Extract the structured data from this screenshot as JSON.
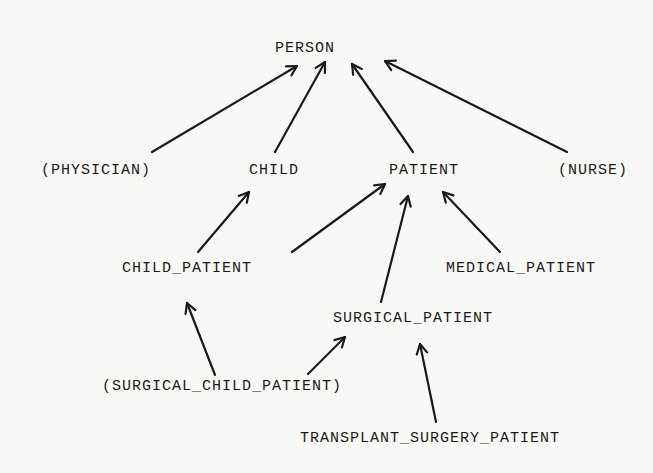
{
  "diagram": {
    "type": "is-a hierarchy",
    "nodes": [
      {
        "id": "person",
        "label": "PERSON",
        "x": 305,
        "y": 48
      },
      {
        "id": "physician",
        "label": "(PHYSICIAN)",
        "x": 96,
        "y": 170
      },
      {
        "id": "child",
        "label": "CHILD",
        "x": 274,
        "y": 170
      },
      {
        "id": "patient",
        "label": "PATIENT",
        "x": 424,
        "y": 170
      },
      {
        "id": "nurse",
        "label": "(NURSE)",
        "x": 593,
        "y": 170
      },
      {
        "id": "child_patient",
        "label": "CHILD_PATIENT",
        "x": 187,
        "y": 268
      },
      {
        "id": "medical_patient",
        "label": "MEDICAL_PATIENT",
        "x": 521,
        "y": 268
      },
      {
        "id": "surgical_patient",
        "label": "SURGICAL_PATIENT",
        "x": 413,
        "y": 318
      },
      {
        "id": "surgical_child_patient",
        "label": "(SURGICAL_CHILD_PATIENT)",
        "x": 222,
        "y": 386
      },
      {
        "id": "transplant_surgery_patient",
        "label": "TRANSPLANT_SURGERY_PATIENT",
        "x": 430,
        "y": 438
      }
    ],
    "edges": [
      {
        "from": "physician",
        "to": "person",
        "x1": 152,
        "y1": 152,
        "x2": 297,
        "y2": 66
      },
      {
        "from": "child",
        "to": "person",
        "x1": 275,
        "y1": 152,
        "x2": 325,
        "y2": 62
      },
      {
        "from": "patient",
        "to": "person",
        "x1": 413,
        "y1": 152,
        "x2": 352,
        "y2": 64
      },
      {
        "from": "nurse",
        "to": "person",
        "x1": 567,
        "y1": 152,
        "x2": 385,
        "y2": 61
      },
      {
        "from": "child_patient",
        "to": "child",
        "x1": 198,
        "y1": 252,
        "x2": 249,
        "y2": 192
      },
      {
        "from": "child_patient",
        "to": "patient",
        "x1": 292,
        "y1": 252,
        "x2": 385,
        "y2": 184
      },
      {
        "from": "surgical_patient",
        "to": "patient",
        "x1": 381,
        "y1": 302,
        "x2": 408,
        "y2": 196
      },
      {
        "from": "medical_patient",
        "to": "patient",
        "x1": 500,
        "y1": 252,
        "x2": 443,
        "y2": 192
      },
      {
        "from": "surgical_child_patient",
        "to": "child_patient",
        "x1": 215,
        "y1": 375,
        "x2": 187,
        "y2": 303
      },
      {
        "from": "surgical_child_patient",
        "to": "surgical_patient",
        "x1": 308,
        "y1": 374,
        "x2": 345,
        "y2": 337
      },
      {
        "from": "transplant_surgery_patient",
        "to": "surgical_patient",
        "x1": 436,
        "y1": 422,
        "x2": 420,
        "y2": 344
      }
    ]
  }
}
